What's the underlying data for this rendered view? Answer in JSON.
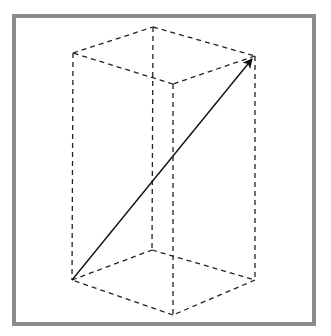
{
  "diagram": {
    "type": "rectangular-prism-with-space-diagonal",
    "frame_color": "#8c8c8c",
    "edge_color": "#222222",
    "arrow_color": "#111111",
    "edge_style": "dashed",
    "vertices": {
      "top_left": [
        73,
        53
      ],
      "top_back": [
        153,
        27
      ],
      "top_right": [
        255,
        56
      ],
      "top_front": [
        173,
        84
      ],
      "bottom_left": [
        72,
        280
      ],
      "bottom_back": [
        152,
        250
      ],
      "bottom_right": [
        255,
        280
      ],
      "bottom_front": [
        173,
        315
      ]
    },
    "diagonal": {
      "from": "bottom_left",
      "to": "top_right",
      "style": "solid",
      "arrowhead": "end"
    }
  }
}
